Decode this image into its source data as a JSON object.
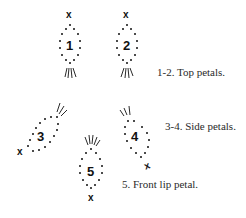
{
  "diagram": {
    "petals": [
      {
        "id": 1,
        "label": "1",
        "group": "top",
        "stitch_start": "x",
        "orientation": "vertical"
      },
      {
        "id": 2,
        "label": "2",
        "group": "top",
        "stitch_start": "x",
        "orientation": "vertical"
      },
      {
        "id": 3,
        "label": "3",
        "group": "side",
        "stitch_start": "x",
        "orientation": "diagonal-left"
      },
      {
        "id": 4,
        "label": "4",
        "group": "side",
        "stitch_start": "x",
        "orientation": "diagonal-right"
      },
      {
        "id": 5,
        "label": "5",
        "group": "front",
        "stitch_start": "x",
        "orientation": "vertical-inverted"
      }
    ],
    "marker": "x",
    "captions": {
      "top": "1-2. Top petals.",
      "side": "3-4. Side petals.",
      "front": "5. Front lip petal."
    },
    "colors": {
      "ink": "#111111",
      "caption": "#2a2a2a",
      "background": "#ffffff"
    }
  }
}
